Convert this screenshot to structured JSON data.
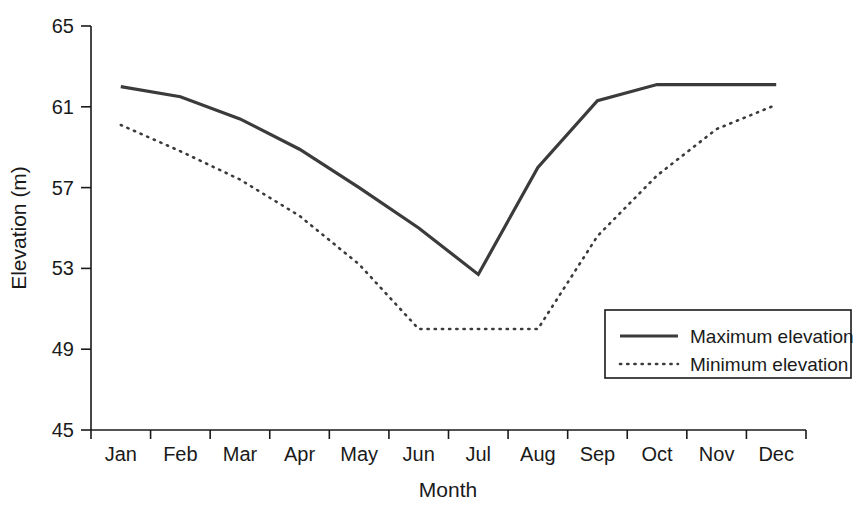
{
  "chart_data": {
    "type": "line",
    "title": "",
    "xlabel": "Month",
    "ylabel": "Elevation (m)",
    "categories": [
      "Jan",
      "Feb",
      "Mar",
      "Apr",
      "May",
      "Jun",
      "Jul",
      "Aug",
      "Sep",
      "Oct",
      "Nov",
      "Dec"
    ],
    "ylim": [
      45,
      65
    ],
    "yticks": [
      45,
      49,
      53,
      57,
      61,
      65
    ],
    "ytick_labels": [
      "45",
      "49",
      "53",
      "57",
      "61",
      "65"
    ],
    "grid": false,
    "legend_position": "bottom-right",
    "series": [
      {
        "name": "Maximum elevation",
        "style": "solid",
        "color": "#3b3b3b",
        "values": [
          62.0,
          61.5,
          60.4,
          58.9,
          57.0,
          55.0,
          52.7,
          58.0,
          61.3,
          62.1,
          62.1,
          62.1
        ]
      },
      {
        "name": "Minimum elevation",
        "style": "dotted",
        "color": "#3b3b3b",
        "values": [
          60.1,
          58.8,
          57.4,
          55.6,
          53.2,
          50.0,
          50.0,
          50.0,
          54.6,
          57.6,
          59.9,
          61.1
        ]
      }
    ]
  },
  "axes": {
    "y_title": "Elevation (m)",
    "x_title": "Month"
  },
  "legend": {
    "items": [
      {
        "label": "Maximum elevation"
      },
      {
        "label": "Minimum elevation"
      }
    ]
  }
}
